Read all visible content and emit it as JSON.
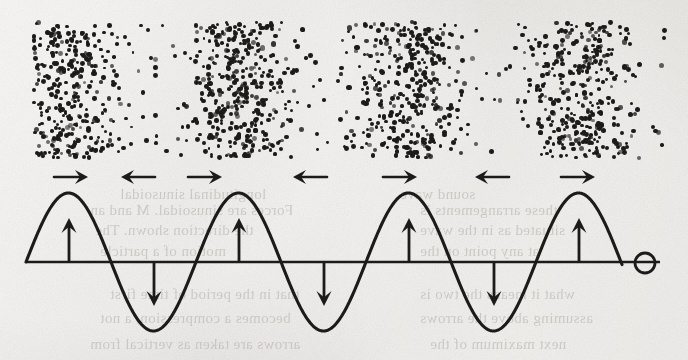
{
  "figure": {
    "width": 688,
    "height": 360,
    "background_color": "#e9e7e3",
    "ink_color": "#1d1b19"
  },
  "chart_data": {
    "type": "line",
    "title": "",
    "subtitle": "",
    "xlabel": "",
    "ylabel": "",
    "grid": false,
    "legend_position": "none",
    "axis": {
      "baseline_y": 262,
      "x_start": 26,
      "x_end": 660,
      "amplitude_px": 69,
      "wavelength_px": 170,
      "phase": "sine starting at zero rising",
      "cycles": 3.5
    },
    "xlim": [
      26,
      660
    ],
    "ylim": [
      -1,
      1
    ],
    "series": [
      {
        "name": "displacement",
        "wave_form": "sine",
        "start_x": 26,
        "end_x": 622,
        "wavelength": 170,
        "amplitude": 69,
        "peaks_x": [
          69,
          239,
          409,
          579
        ],
        "troughs_x": [
          154,
          324,
          494
        ],
        "zero_crossings_x": [
          26,
          111,
          196,
          281,
          366,
          451,
          536,
          622
        ]
      }
    ],
    "annotations": {
      "displacement_arrows": [
        {
          "x": 69,
          "direction": "up",
          "label": "crest-displacement-up"
        },
        {
          "x": 154,
          "direction": "down",
          "label": "trough-displacement-down"
        },
        {
          "x": 239,
          "direction": "up",
          "label": "crest-displacement-up"
        },
        {
          "x": 324,
          "direction": "down",
          "label": "trough-displacement-down"
        },
        {
          "x": 409,
          "direction": "up",
          "label": "crest-displacement-up"
        },
        {
          "x": 494,
          "direction": "down",
          "label": "trough-displacement-down"
        },
        {
          "x": 579,
          "direction": "up",
          "label": "crest-displacement-up"
        }
      ],
      "particle-motion-arrows": [
        {
          "x": 71,
          "direction": "right"
        },
        {
          "x": 138,
          "direction": "left"
        },
        {
          "x": 205,
          "direction": "right"
        },
        {
          "x": 310,
          "direction": "left"
        },
        {
          "x": 400,
          "direction": "right"
        },
        {
          "x": 492,
          "direction": "left"
        },
        {
          "x": 578,
          "direction": "right"
        }
      ],
      "end_marker": {
        "shape": "circle",
        "x": 645,
        "y": 263,
        "radius": 10,
        "filled": false
      }
    }
  },
  "particle_field": {
    "name": "longitudinal-particle-density-field",
    "bounds": {
      "left": 33,
      "top": 22,
      "right": 668,
      "bottom": 158
    },
    "compression_centers_x": [
      70,
      240,
      410,
      575
    ],
    "rarefaction_centers_x": [
      155,
      325,
      495
    ],
    "wavelength_px": 170,
    "dot_count": 1450,
    "dot_radius_px": [
      1.4,
      2.6
    ],
    "description": "alternating compressions and rarefactions of a longitudinal sound wave"
  },
  "showthrough_text": {
    "description": "faint mirrored text bleeding through from the reverse side of the page",
    "lines": [
      {
        "text": "longitudinal sinusoidal",
        "x": 120,
        "y": 186,
        "size": 15
      },
      {
        "text": "sound wave",
        "x": 400,
        "y": 186,
        "size": 15
      },
      {
        "text": "Forces are sinusoidal. M and an",
        "x": 90,
        "y": 202,
        "size": 15
      },
      {
        "text": "these arrangements is",
        "x": 420,
        "y": 202,
        "size": 15
      },
      {
        "text": "the direction shown. The",
        "x": 95,
        "y": 222,
        "size": 15
      },
      {
        "text": "situated as in the wave",
        "x": 420,
        "y": 222,
        "size": 15
      },
      {
        "text": "motion of a particle",
        "x": 100,
        "y": 243,
        "size": 15
      },
      {
        "text": "at any point on the",
        "x": 420,
        "y": 243,
        "size": 15
      },
      {
        "text": "that in the period of time first",
        "x": 110,
        "y": 286,
        "size": 15
      },
      {
        "text": "what it means the two is",
        "x": 420,
        "y": 286,
        "size": 15
      },
      {
        "text": "becomes a compression, a not",
        "x": 100,
        "y": 310,
        "size": 15
      },
      {
        "text": "assuming above the arrows",
        "x": 420,
        "y": 310,
        "size": 15
      },
      {
        "text": "arrows are taken as vertical from",
        "x": 90,
        "y": 336,
        "size": 15
      },
      {
        "text": "next maximum of the",
        "x": 430,
        "y": 336,
        "size": 15
      }
    ]
  }
}
